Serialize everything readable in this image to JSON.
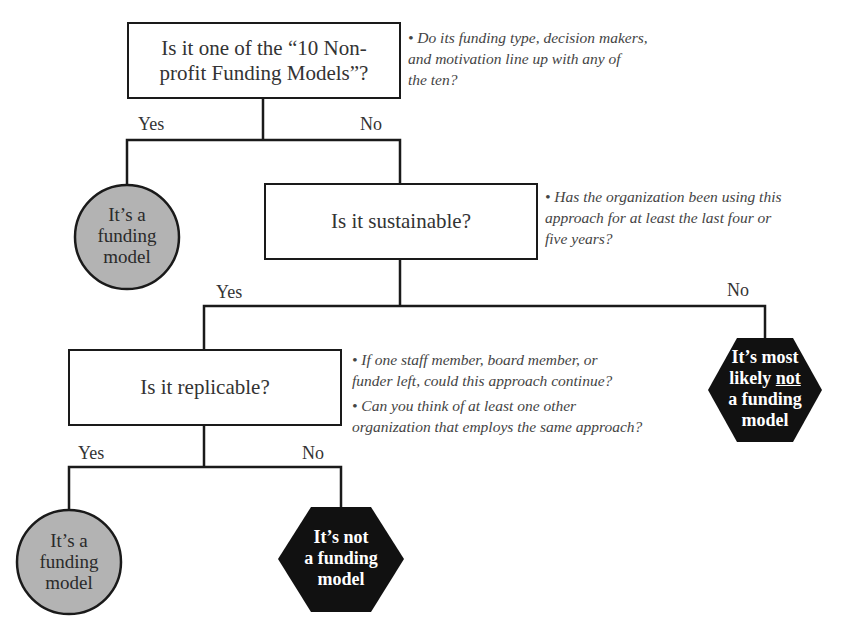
{
  "diagram": {
    "type": "decision-tree",
    "nodes": {
      "q1": {
        "text": "Is it one of the “10 Non-profit Funding Models”?",
        "line1": "Is it one of the “10 Non-",
        "line2": "profit Funding Models”?"
      },
      "q1_note": "• Do its funding type, decision makers, and motivation line up with any of the ten?",
      "q1_note_lines": [
        "• Do its funding type, decision makers,",
        "and motivation line up with any of",
        "the ten?"
      ],
      "q2": {
        "text": "Is it sustainable?"
      },
      "q2_note_lines": [
        "• Has the organization been using this",
        "approach for at least the last four or",
        "five years?"
      ],
      "q3": {
        "text": "Is it replicable?"
      },
      "q3_notes": [
        {
          "lines": [
            "• If one staff member, board member, or",
            "funder left, could this approach continue?"
          ]
        },
        {
          "lines": [
            "• Can you think of at least one other",
            "organization that employs the same approach?"
          ]
        }
      ],
      "outcome_yes_1": {
        "lines": [
          "It’s a",
          "funding",
          "model"
        ],
        "shape": "circle",
        "fill": "#b3b3b3"
      },
      "outcome_no_2": {
        "lines": [
          "It’s most",
          "likely",
          "not",
          "a funding",
          "model"
        ],
        "shape": "hexagon",
        "fill": "#111111"
      },
      "outcome_yes_3": {
        "lines": [
          "It’s a",
          "funding",
          "model"
        ],
        "shape": "circle",
        "fill": "#b3b3b3"
      },
      "outcome_no_3": {
        "lines": [
          "It’s not",
          "a funding",
          "model"
        ],
        "shape": "hexagon",
        "fill": "#111111"
      }
    },
    "branch_labels": {
      "q1_yes": "Yes",
      "q1_no": "No",
      "q2_yes": "Yes",
      "q2_no": "No",
      "q3_yes": "Yes",
      "q3_no": "No"
    },
    "colors": {
      "line": "#1a1a1a",
      "positive_fill": "#b3b3b3",
      "negative_fill": "#111111"
    }
  }
}
